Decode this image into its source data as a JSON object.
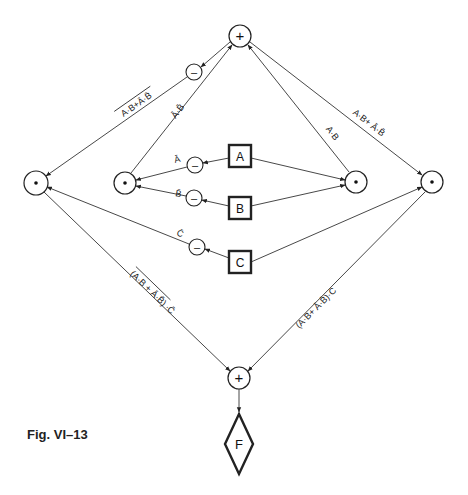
{
  "caption": "Fig. VI–13",
  "nodes": {
    "top_or": "+",
    "bottom_or": "+",
    "input_a": "A",
    "input_b": "B",
    "input_c": "C",
    "output_f": "F",
    "not_symbol": "–",
    "and_symbol": "•"
  },
  "edge_labels": {
    "top_left_outer": "A·B + Ā·B̄ (negated)",
    "top_left_inner": "Ā·B̄",
    "top_right_inner": "A·B",
    "top_right_outer": "A·B + Ā·B̄",
    "not_a": "Ā",
    "not_b": "B̄",
    "not_c": "C̄",
    "bottom_left": "(A·B + Ā·B̄)·C̄ (parenthesized term negated)",
    "bottom_right": "(A·B + Ā·B̄)·C"
  },
  "edge_label_text": {
    "top_left_outer": "A·B+Ā·B̄",
    "top_left_inner": "Ā·B̄",
    "top_right_inner": "A·B",
    "top_right_outer": "A·B+ Ā·B̄",
    "not_a": "Ā",
    "not_b": "B̄",
    "not_c": "C̄",
    "bottom_left_paren": "(A·B + Ā·B̄)",
    "bottom_left_tail": "·C̄",
    "bottom_right": "(A·B+ Ā·B̄)·C"
  }
}
